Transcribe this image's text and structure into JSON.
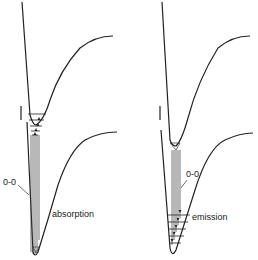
{
  "panels": [
    {
      "id": "absorption",
      "label": "absorption",
      "transition_label": "0-0",
      "arrow_direction": "up"
    },
    {
      "id": "emission",
      "label": "emission",
      "transition_label": "0-0",
      "arrow_direction": "down"
    }
  ],
  "colors": {
    "line": "#222222",
    "background": "#ffffff"
  }
}
